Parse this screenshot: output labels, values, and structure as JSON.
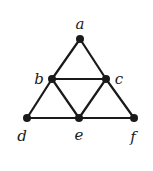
{
  "graph": {
    "nodes": [
      {
        "id": "a",
        "label": "a",
        "x": 80,
        "y": 39,
        "lx": 80,
        "ly": 29
      },
      {
        "id": "b",
        "label": "b",
        "x": 52,
        "y": 79,
        "lx": 39,
        "ly": 84
      },
      {
        "id": "c",
        "label": "c",
        "x": 106,
        "y": 79,
        "lx": 119,
        "ly": 84
      },
      {
        "id": "d",
        "label": "d",
        "x": 27,
        "y": 118,
        "lx": 22,
        "ly": 141
      },
      {
        "id": "e",
        "label": "e",
        "x": 79,
        "y": 118,
        "lx": 79,
        "ly": 140
      },
      {
        "id": "f",
        "label": "f",
        "x": 134,
        "y": 118,
        "lx": 133,
        "ly": 142
      }
    ],
    "edges": [
      [
        "a",
        "b"
      ],
      [
        "a",
        "c"
      ],
      [
        "b",
        "c"
      ],
      [
        "b",
        "d"
      ],
      [
        "b",
        "e"
      ],
      [
        "c",
        "e"
      ],
      [
        "c",
        "f"
      ],
      [
        "d",
        "e"
      ],
      [
        "e",
        "f"
      ]
    ]
  }
}
